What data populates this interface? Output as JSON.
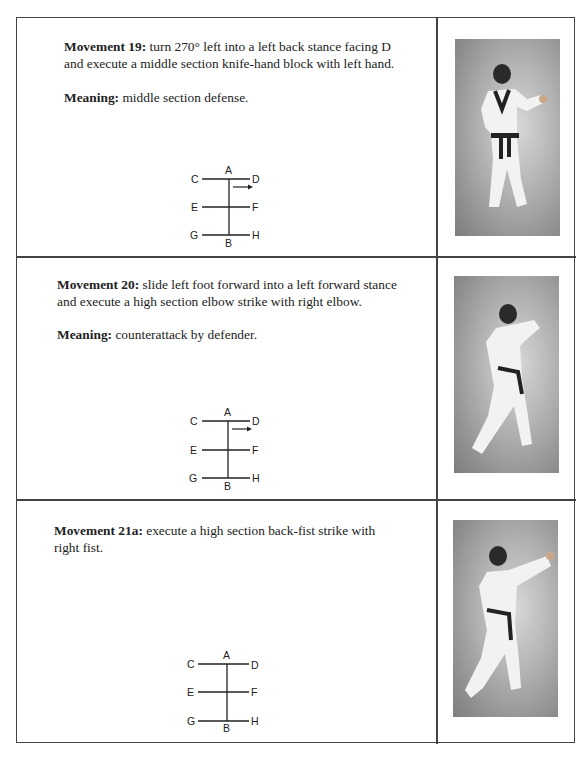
{
  "rows": [
    {
      "movement_label": "Movement 19:",
      "movement_text": " turn 270° left into a left back stance facing D and execute a middle section knife-hand block with left hand.",
      "meaning_label": "Meaning:",
      "meaning_text": " middle section defense.",
      "diagram": {
        "labels": {
          "A": "A",
          "B": "B",
          "C": "C",
          "D": "D",
          "E": "E",
          "F": "F",
          "G": "G",
          "H": "H"
        },
        "arrow": "right"
      },
      "photo": "photo-martial-artist-back-stance-knife-hand-block"
    },
    {
      "movement_label": "Movement 20:",
      "movement_text": " slide left foot forward into a left forward stance and execute a high section elbow strike with right elbow.",
      "meaning_label": "Meaning:",
      "meaning_text": " counterattack by defender.",
      "diagram": {
        "labels": {
          "A": "A",
          "B": "B",
          "C": "C",
          "D": "D",
          "E": "E",
          "F": "F",
          "G": "G",
          "H": "H"
        },
        "arrow": "right"
      },
      "photo": "photo-martial-artist-forward-stance-elbow-strike"
    },
    {
      "movement_label": "Movement 21a:",
      "movement_text": " execute a high section back-fist strike with right fist.",
      "diagram": {
        "labels": {
          "A": "A",
          "B": "B",
          "C": "C",
          "D": "D",
          "E": "E",
          "F": "F",
          "G": "G",
          "H": "H"
        },
        "arrow": "none"
      },
      "photo": "photo-martial-artist-back-fist-strike"
    }
  ]
}
